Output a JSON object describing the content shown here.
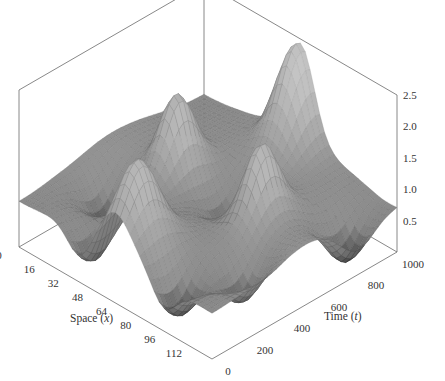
{
  "chart_data": {
    "type": "surface3d",
    "title": "",
    "xlabel": "Space (x)",
    "xlabel_text": "Space (",
    "xlabel_var": "x",
    "ylabel": "Time (t)",
    "ylabel_text": "Time (",
    "ylabel_var": "t",
    "zlabel": "",
    "x_ticks": [
      0,
      16,
      32,
      48,
      64,
      80,
      96,
      112
    ],
    "x_range": [
      0,
      128
    ],
    "y_ticks": [
      0,
      200,
      400,
      600,
      800,
      1000
    ],
    "y_range": [
      0,
      1000
    ],
    "z_ticks": [
      "0.5",
      "1.0",
      "1.5",
      "2.0",
      "2.5"
    ],
    "z_range": [
      0,
      2.5
    ],
    "grid": false,
    "colormap": "gray",
    "baseline_level": 0.85,
    "peaks": [
      {
        "x": 64,
        "t": 980,
        "height": 2.35,
        "width_x": 9,
        "width_t": 90,
        "note": "tallest peak at back"
      },
      {
        "x": 36,
        "t": 560,
        "height": 2.0,
        "width_x": 7,
        "width_t": 80
      },
      {
        "x": 92,
        "t": 560,
        "height": 2.0,
        "width_x": 7,
        "width_t": 80
      },
      {
        "x": 64,
        "t": 120,
        "height": 2.0,
        "width_x": 9,
        "width_t": 90
      }
    ],
    "troughs": [
      {
        "x": 20,
        "t": 300,
        "depth": 0.1
      },
      {
        "x": 112,
        "t": 300,
        "depth": 0.1
      },
      {
        "x": 64,
        "t": 600,
        "depth": 0.3
      },
      {
        "x": 120,
        "t": 780,
        "depth": 0.05
      },
      {
        "x": 40,
        "t": 80,
        "depth": 0.05
      },
      {
        "x": 96,
        "t": 80,
        "depth": 0.05
      }
    ]
  }
}
